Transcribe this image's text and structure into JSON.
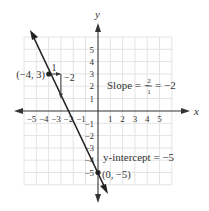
{
  "figure": {
    "axes": {
      "x_label": "x",
      "y_label": "y",
      "x_ticks": [
        "−5",
        "−4",
        "−3",
        "−2",
        "−1",
        "1",
        "2",
        "3",
        "4",
        "5"
      ],
      "y_ticks_pos": [
        "5",
        "4",
        "3",
        "2",
        "1"
      ],
      "y_ticks_neg": [
        "−1",
        "−2",
        "−3",
        "−4",
        "−5"
      ]
    },
    "point_a": {
      "label": "(−4, 3)",
      "x": -4,
      "y": 3
    },
    "point_b": {
      "label": "(0, −5)",
      "x": 0,
      "y": -5
    },
    "rise_run": {
      "run_label": "1",
      "rise_label": "−2"
    },
    "slope_text": {
      "prefix": "Slope = −",
      "num": "2",
      "den": "1",
      "suffix": "= −2"
    },
    "intercept_text": "y-intercept = −5",
    "colors": {
      "line": "#222222",
      "grid": "#e4e4e4",
      "axis": "#333333",
      "text": "#333333"
    }
  }
}
